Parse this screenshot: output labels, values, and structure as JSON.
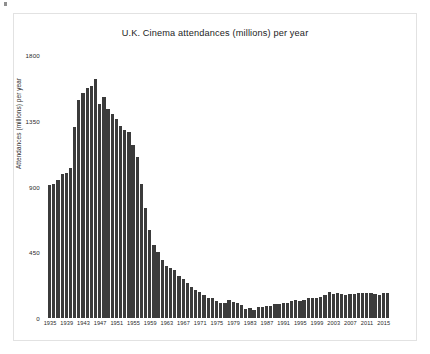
{
  "chart_data": {
    "type": "bar",
    "title": "U.K. Cinema attendances (millions) per year",
    "xlabel": "",
    "ylabel": "Attendances (millions) per year",
    "ylim": [
      0,
      1800
    ],
    "yticks": [
      0,
      450,
      900,
      1350,
      1800
    ],
    "ytick_labels": [
      "0",
      "450",
      "900",
      "1350",
      "1800"
    ],
    "xtick_labels": [
      "1935",
      "1939",
      "1943",
      "1947",
      "1951",
      "1955",
      "1959",
      "1963",
      "1967",
      "1971",
      "1975",
      "1979",
      "1983",
      "1987",
      "1991",
      "1995",
      "1999",
      "2003",
      "2007",
      "2011",
      "2015"
    ],
    "xtick_step_years": 4,
    "grid": false,
    "legend": false,
    "bar_color": "#3b3b3b",
    "categories": [
      "1935",
      "1936",
      "1937",
      "1938",
      "1939",
      "1940",
      "1941",
      "1942",
      "1943",
      "1944",
      "1945",
      "1946",
      "1947",
      "1948",
      "1949",
      "1950",
      "1951",
      "1952",
      "1953",
      "1954",
      "1955",
      "1956",
      "1957",
      "1958",
      "1959",
      "1960",
      "1961",
      "1962",
      "1963",
      "1964",
      "1965",
      "1966",
      "1967",
      "1968",
      "1969",
      "1970",
      "1971",
      "1972",
      "1973",
      "1974",
      "1975",
      "1976",
      "1977",
      "1978",
      "1979",
      "1980",
      "1981",
      "1982",
      "1983",
      "1984",
      "1985",
      "1986",
      "1987",
      "1988",
      "1989",
      "1990",
      "1991",
      "1992",
      "1993",
      "1994",
      "1995",
      "1996",
      "1997",
      "1998",
      "1999",
      "2000",
      "2001",
      "2002",
      "2003",
      "2004",
      "2005",
      "2006",
      "2007",
      "2008",
      "2009",
      "2010",
      "2011",
      "2012",
      "2013",
      "2014",
      "2015",
      "2016"
    ],
    "values": [
      912,
      917,
      946,
      987,
      990,
      1027,
      1309,
      1494,
      1541,
      1575,
      1585,
      1635,
      1462,
      1514,
      1430,
      1396,
      1365,
      1312,
      1285,
      1276,
      1182,
      1101,
      915,
      755,
      601,
      501,
      449,
      395,
      357,
      342,
      327,
      289,
      265,
      237,
      215,
      193,
      176,
      156,
      134,
      138,
      116,
      104,
      103,
      126,
      112,
      101,
      86,
      64,
      66,
      54,
      72,
      75,
      79,
      84,
      95,
      97,
      100,
      104,
      114,
      124,
      115,
      124,
      139,
      135,
      140,
      143,
      156,
      176,
      167,
      171,
      165,
      157,
      162,
      164,
      174,
      169,
      172,
      173,
      166,
      158,
      172,
      168
    ]
  }
}
